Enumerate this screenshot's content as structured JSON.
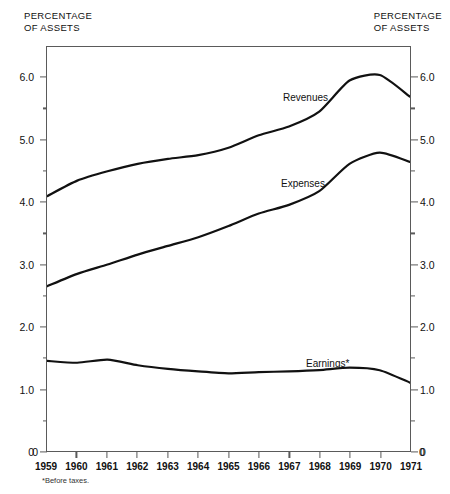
{
  "header": {
    "left_title": "PERCENTAGE\nOF ASSETS",
    "right_title": "PERCENTAGE\nOF ASSETS"
  },
  "footnote": "*Before taxes.",
  "axis": {
    "y_major_labels": [
      "6.0",
      "5.0",
      "4.0",
      "3.0",
      "2.0",
      "1.0",
      "0"
    ],
    "y_major_values": [
      6.0,
      5.0,
      4.0,
      3.0,
      2.0,
      1.0,
      0
    ],
    "y_minor_values": [
      5.5,
      4.5,
      3.5,
      2.5,
      1.5,
      0.5
    ],
    "x_labels": [
      "1959",
      "1960",
      "1961",
      "1962",
      "1963",
      "1964",
      "1965",
      "1966",
      "1967",
      "1968",
      "1969",
      "1970",
      "1971"
    ]
  },
  "series_labels": {
    "revenues": "Revenues",
    "expenses": "Expenses",
    "earnings": "Earnings*"
  },
  "chart_data": {
    "type": "line",
    "title": "PERCENTAGE OF ASSETS",
    "xlabel": "",
    "ylabel": "PERCENTAGE OF ASSETS",
    "ylim": [
      0,
      6.5
    ],
    "xlim": [
      1959,
      1971
    ],
    "grid": false,
    "legend": "inline-labels",
    "annotations": [
      "*Before taxes."
    ],
    "categories": [
      1959,
      1960,
      1961,
      1962,
      1963,
      1964,
      1965,
      1966,
      1967,
      1968,
      1969,
      1970,
      1971
    ],
    "series": [
      {
        "name": "Revenues",
        "color": "#111111",
        "values": [
          4.1,
          4.35,
          4.5,
          4.62,
          4.7,
          4.76,
          4.88,
          5.08,
          5.22,
          5.46,
          5.96,
          6.05,
          5.7
        ]
      },
      {
        "name": "Expenses",
        "color": "#111111",
        "values": [
          2.65,
          2.85,
          3.0,
          3.16,
          3.3,
          3.44,
          3.62,
          3.82,
          3.96,
          4.18,
          4.62,
          4.8,
          4.65
        ]
      },
      {
        "name": "Earnings*",
        "color": "#111111",
        "values": [
          1.45,
          1.42,
          1.47,
          1.38,
          1.32,
          1.28,
          1.25,
          1.27,
          1.28,
          1.3,
          1.34,
          1.3,
          1.1
        ]
      }
    ]
  }
}
